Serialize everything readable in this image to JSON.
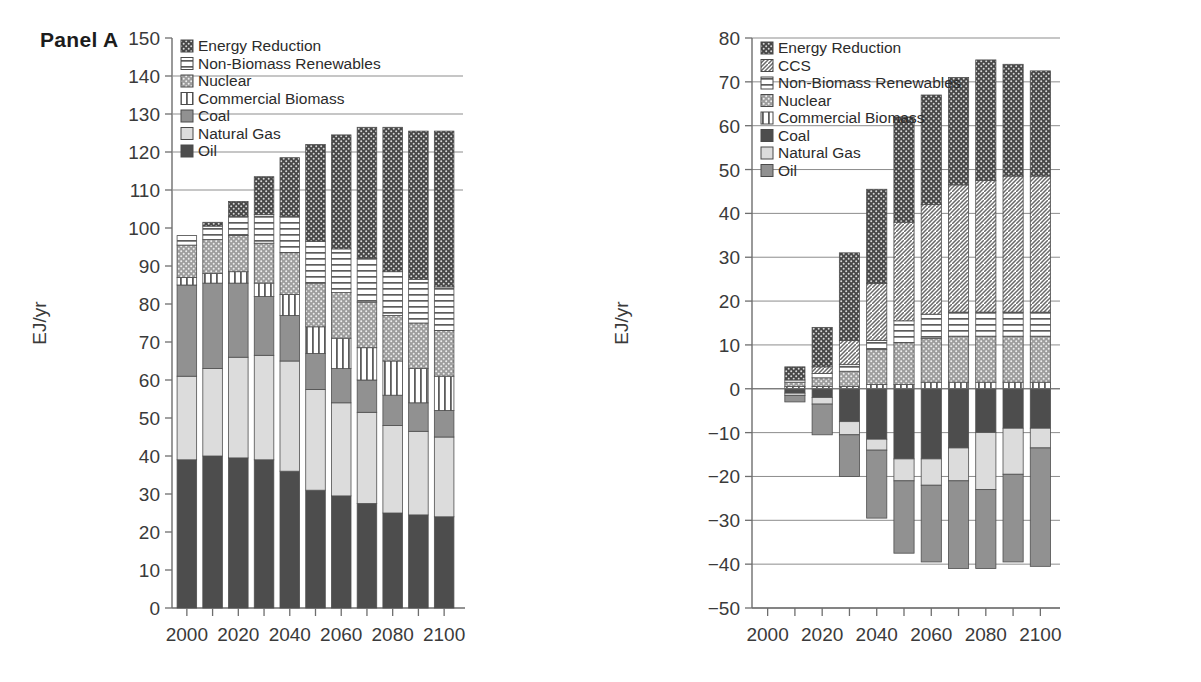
{
  "figure": {
    "panelA_title": "Panel A",
    "panelB_title": "Panel B",
    "footnote": ""
  },
  "chart_data": [
    {
      "type": "bar",
      "title": "Panel A",
      "subtitle": "",
      "stacked": true,
      "xlabel": "",
      "ylabel": "EJ/yr",
      "ylim": [
        0,
        150
      ],
      "ytick_step": 10,
      "yticks": [
        0,
        10,
        20,
        30,
        40,
        50,
        60,
        70,
        80,
        90,
        100,
        110,
        120,
        130,
        140,
        150
      ],
      "grid": true,
      "legend_position": "top-left",
      "x": [
        2000,
        2010,
        2020,
        2030,
        2040,
        2050,
        2060,
        2070,
        2080,
        2090,
        2100
      ],
      "categories": [
        "2000",
        "2010",
        "2020",
        "2030",
        "2040",
        "2050",
        "2060",
        "2070",
        "2080",
        "2090",
        "2100"
      ],
      "xtick_labels": [
        "2000",
        "",
        "2020",
        "",
        "2040",
        "",
        "2060",
        "",
        "2080",
        "",
        "2100"
      ],
      "series": [
        {
          "name": "Oil",
          "pattern": "solid-dark",
          "values": [
            39.0,
            40.0,
            39.5,
            39.0,
            36.0,
            31.0,
            29.5,
            27.5,
            25.0,
            24.5,
            24.0
          ]
        },
        {
          "name": "Natural Gas",
          "pattern": "solid-light",
          "values": [
            22.0,
            23.0,
            26.5,
            27.5,
            29.0,
            26.5,
            24.5,
            24.0,
            23.0,
            22.0,
            21.0
          ]
        },
        {
          "name": "Coal",
          "pattern": "solid-mid",
          "values": [
            24.0,
            22.5,
            19.5,
            15.5,
            12.0,
            9.5,
            9.0,
            8.5,
            8.0,
            7.5,
            7.0
          ]
        },
        {
          "name": "Commercial Biomass",
          "pattern": "vertical-stripe",
          "values": [
            2.0,
            2.5,
            3.0,
            3.5,
            5.5,
            7.0,
            8.0,
            8.5,
            9.0,
            9.0,
            9.0
          ]
        },
        {
          "name": "Nuclear",
          "pattern": "dotted-mid",
          "values": [
            8.5,
            9.0,
            9.5,
            10.5,
            11.0,
            11.5,
            12.0,
            12.0,
            12.0,
            12.0,
            12.0
          ]
        },
        {
          "name": "Non-Biomass Renewables",
          "pattern": "horizontal-stripe",
          "values": [
            2.5,
            3.5,
            5.0,
            7.5,
            9.5,
            11.0,
            11.5,
            11.5,
            11.5,
            11.5,
            11.5
          ]
        },
        {
          "name": "Energy Reduction",
          "pattern": "dotted-dark",
          "values": [
            0.0,
            1.0,
            4.0,
            10.0,
            15.5,
            25.5,
            30.0,
            34.5,
            38.0,
            39.0,
            41.0
          ]
        }
      ],
      "totals": [
        98.0,
        101.5,
        107.0,
        113.5,
        118.5,
        122.0,
        124.5,
        126.5,
        126.5,
        125.5,
        125.5
      ]
    },
    {
      "type": "bar",
      "title": "Panel B",
      "subtitle": "",
      "stacked": true,
      "note": "Positive values are increases, negative values are reductions relative to reference",
      "xlabel": "",
      "ylabel": "EJ/yr",
      "ylim": [
        -50,
        80
      ],
      "ytick_step": 10,
      "yticks": [
        -50,
        -40,
        -30,
        -20,
        -10,
        0,
        10,
        20,
        30,
        40,
        50,
        60,
        70,
        80
      ],
      "grid": true,
      "legend_position": "top-left",
      "x": [
        2000,
        2010,
        2020,
        2030,
        2040,
        2050,
        2060,
        2070,
        2080,
        2090,
        2100
      ],
      "categories": [
        "2000",
        "2010",
        "2020",
        "2030",
        "2040",
        "2050",
        "2060",
        "2070",
        "2080",
        "2090",
        "2100"
      ],
      "xtick_labels": [
        "2000",
        "",
        "2020",
        "",
        "2040",
        "",
        "2060",
        "",
        "2080",
        "",
        "2100"
      ],
      "series_positive": [
        {
          "name": "Oil",
          "pattern": "solid-mid",
          "values": [
            0.0,
            0.0,
            0.0,
            0.0,
            0.0,
            0.0,
            0.0,
            0.0,
            0.0,
            0.0,
            0.0
          ]
        },
        {
          "name": "Natural Gas",
          "pattern": "solid-light",
          "values": [
            0.0,
            0.0,
            0.0,
            0.0,
            0.0,
            0.0,
            0.0,
            0.0,
            0.0,
            0.0,
            0.0
          ]
        },
        {
          "name": "Coal",
          "pattern": "solid-dark",
          "values": [
            0.0,
            0.0,
            0.0,
            0.0,
            0.0,
            0.0,
            0.0,
            0.0,
            0.0,
            0.0,
            0.0
          ]
        },
        {
          "name": "Commercial Biomass",
          "pattern": "vertical-stripe",
          "values": [
            0.0,
            0.5,
            0.5,
            0.5,
            1.0,
            1.0,
            1.5,
            1.5,
            1.5,
            1.5,
            1.5
          ]
        },
        {
          "name": "Nuclear",
          "pattern": "dotted-mid",
          "values": [
            0.0,
            1.0,
            2.0,
            3.5,
            8.0,
            9.5,
            10.0,
            10.5,
            10.5,
            10.5,
            10.5
          ]
        },
        {
          "name": "Non-Biomass Renewables",
          "pattern": "horizontal-stripe",
          "values": [
            0.0,
            0.5,
            1.0,
            1.5,
            2.0,
            5.0,
            5.5,
            5.5,
            5.5,
            5.5,
            5.5
          ]
        },
        {
          "name": "CCS",
          "pattern": "diagonal-hatch",
          "values": [
            0.0,
            0.0,
            1.5,
            5.5,
            13.0,
            22.5,
            25.0,
            29.0,
            30.0,
            31.0,
            31.0
          ]
        },
        {
          "name": "Energy Reduction",
          "pattern": "dotted-dark",
          "values": [
            0.0,
            3.0,
            9.0,
            20.0,
            21.5,
            24.0,
            25.0,
            24.5,
            27.5,
            25.5,
            24.0
          ]
        }
      ],
      "series_negative": [
        {
          "name": "Oil",
          "pattern": "solid-mid",
          "values": [
            0.0,
            -1.5,
            -7.0,
            -9.5,
            -15.5,
            -16.5,
            -17.5,
            -20.0,
            -18.0,
            -20.0,
            -27.0
          ]
        },
        {
          "name": "Natural Gas",
          "pattern": "solid-light",
          "values": [
            0.0,
            -0.5,
            -1.5,
            -3.0,
            -2.5,
            -5.0,
            -6.0,
            -7.5,
            -13.0,
            -10.5,
            -4.5
          ]
        },
        {
          "name": "Coal",
          "pattern": "solid-dark",
          "values": [
            0.0,
            -1.0,
            -2.0,
            -7.5,
            -11.5,
            -16.0,
            -16.0,
            -13.5,
            -10.0,
            -9.0,
            -9.0
          ]
        }
      ],
      "positive_totals": [
        0.0,
        5.0,
        14.0,
        31.0,
        45.5,
        62.0,
        67.0,
        71.0,
        75.0,
        74.0,
        72.5
      ],
      "negative_totals": [
        0.0,
        -3.0,
        -10.5,
        -20.0,
        -29.5,
        -37.5,
        -39.5,
        -41.0,
        -41.0,
        -39.5,
        -40.5
      ]
    }
  ],
  "panelA": {
    "title": "Panel A",
    "ylabel": "EJ/yr",
    "yticks": [
      "0",
      "10",
      "20",
      "30",
      "40",
      "50",
      "60",
      "70",
      "80",
      "90",
      "100",
      "110",
      "120",
      "130",
      "140",
      "150"
    ],
    "xticks": [
      "2000",
      "2020",
      "2040",
      "2060",
      "2080",
      "2100"
    ],
    "legend": [
      {
        "label": "Energy Reduction",
        "swatch": "dotted-dark"
      },
      {
        "label": "Non-Biomass Renewables",
        "swatch": "horizontal-stripe"
      },
      {
        "label": "Nuclear",
        "swatch": "dotted-mid"
      },
      {
        "label": "Commercial Biomass",
        "swatch": "vertical-stripe"
      },
      {
        "label": "Coal",
        "swatch": "solid-mid"
      },
      {
        "label": "Natural Gas",
        "swatch": "solid-light"
      },
      {
        "label": "Oil",
        "swatch": "solid-dark"
      }
    ]
  },
  "panelB": {
    "title": "Panel B",
    "ylabel": "EJ/yr",
    "yticks": [
      "-50",
      "-40",
      "-30",
      "-20",
      "-10",
      "0",
      "10",
      "20",
      "30",
      "40",
      "50",
      "60",
      "70",
      "80"
    ],
    "xticks": [
      "2000",
      "2020",
      "2040",
      "2060",
      "2080",
      "2100"
    ],
    "legend": [
      {
        "label": "Energy Reduction",
        "swatch": "dotted-dark"
      },
      {
        "label": "CCS",
        "swatch": "diagonal-hatch"
      },
      {
        "label": "Non-Biomass Renewables",
        "swatch": "horizontal-stripe"
      },
      {
        "label": "Nuclear",
        "swatch": "dotted-mid"
      },
      {
        "label": "Commercial Biomass",
        "swatch": "vertical-stripe"
      },
      {
        "label": "Coal",
        "swatch": "solid-dark"
      },
      {
        "label": "Natural Gas",
        "swatch": "solid-light"
      },
      {
        "label": "Oil",
        "swatch": "solid-mid"
      }
    ]
  },
  "colors": {
    "solid_dark": "#4a4a4a",
    "solid_mid": "#8c8c8c",
    "solid_light": "#d9d9d9",
    "dotted_dark": "#4f4f4f",
    "dotted_mid": "#9a9a9a",
    "stroke": "#5a5a5a",
    "axis": "#6e6e6e",
    "text": "#3a3a3a"
  }
}
